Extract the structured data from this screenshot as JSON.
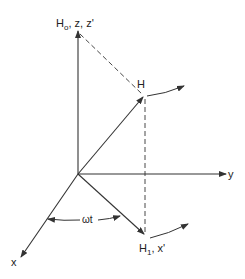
{
  "diagram": {
    "type": "rotating-frame-vector-diagram",
    "labels": {
      "z_axis": {
        "main": "H",
        "sub": "o",
        "rest": ", z, z'"
      },
      "h_vector": "H",
      "y_axis": "y",
      "x_axis": "x",
      "h1_vector": {
        "main": "H",
        "sub": "1",
        "rest": ", x'"
      },
      "angle": "ωt"
    },
    "colors": {
      "line": "#333333",
      "text": "#222222",
      "background": "#ffffff"
    }
  }
}
